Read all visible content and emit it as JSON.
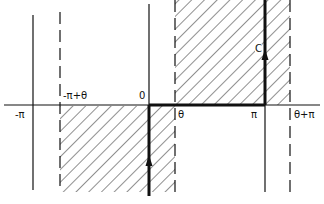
{
  "figure": {
    "axis_labels": {
      "neg_pi": "-π",
      "neg_pi_plus_theta": "-π+θ",
      "zero": "0",
      "theta": "θ",
      "pi": "π",
      "theta_plus_pi": "θ+π"
    },
    "contour_label": "C",
    "colors": {
      "ink": "#111111",
      "background": "#ffffff"
    }
  }
}
